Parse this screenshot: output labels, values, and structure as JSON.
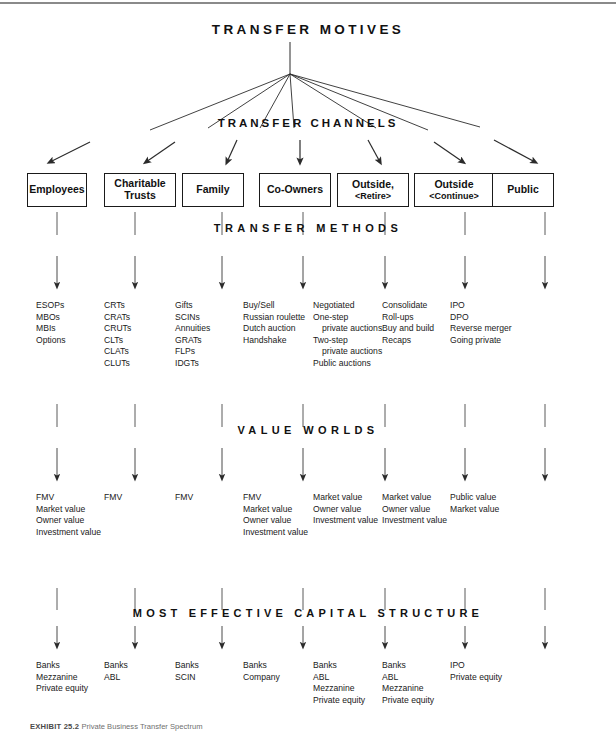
{
  "diagram": {
    "band_titles": {
      "motives": "TRANSFER MOTIVES",
      "channels": "TRANSFER CHANNELS",
      "methods": "TRANSFER METHODS",
      "value_worlds": "VALUE WORLDS",
      "capital_structure": "MOST EFFECTIVE CAPITAL STRUCTURE"
    },
    "channel_boxes": [
      {
        "line1": "Employees",
        "line2": ""
      },
      {
        "line1": "Charitable",
        "line2": "Trusts"
      },
      {
        "line1": "Family",
        "line2": ""
      },
      {
        "line1": "Co-Owners",
        "line2": ""
      },
      {
        "line1": "Outside,",
        "line2": "<Retire>"
      },
      {
        "line1": "Outside",
        "line2": "<Continue>"
      },
      {
        "line1": "Public",
        "line2": ""
      }
    ],
    "transfer_methods": [
      [
        "ESOPs",
        "MBOs",
        "MBIs",
        "Options"
      ],
      [
        "CRTs",
        "CRATs",
        "CRUTs",
        "CLTs",
        "CLATs",
        "CLUTs"
      ],
      [
        "Gifts",
        "SCINs",
        "Annuities",
        "GRATs",
        "FLPs",
        "IDGTs"
      ],
      [
        "Buy/Sell",
        "Russian roulette",
        "Dutch auction",
        "Handshake"
      ],
      [
        "Negotiated",
        "One-step",
        "private auctions",
        "Two-step",
        "private auctions",
        "Public auctions"
      ],
      [
        "Consolidate",
        "Roll-ups",
        "Buy and build",
        "Recaps"
      ],
      [
        "IPO",
        "DPO",
        "Reverse merger",
        "Going private"
      ]
    ],
    "transfer_methods_indented": [
      [],
      [],
      [],
      [],
      [
        2,
        4
      ],
      [],
      []
    ],
    "value_worlds": [
      [
        "FMV",
        "Market value",
        "Owner value",
        "Investment value"
      ],
      [
        "FMV"
      ],
      [
        "FMV"
      ],
      [
        "FMV",
        "Market value",
        "Owner value",
        "Investment value"
      ],
      [
        "Market value",
        "Owner value",
        "Investment value"
      ],
      [
        "Market value",
        "Owner value",
        "Investment value"
      ],
      [
        "Public value",
        "Market value"
      ]
    ],
    "capital_structure": [
      [
        "Banks",
        "Mezzanine",
        "Private equity"
      ],
      [
        "Banks",
        "ABL"
      ],
      [
        "Banks",
        "SCIN"
      ],
      [
        "Banks",
        "Company"
      ],
      [
        "Banks",
        "ABL",
        "Mezzanine",
        "Private equity"
      ],
      [
        "Banks",
        "ABL",
        "Mezzanine",
        "Private equity"
      ],
      [
        "IPO",
        "Private equity"
      ]
    ],
    "caption": {
      "label": "EXHIBIT 25.2",
      "text": "Private Business Transfer Spectrum"
    },
    "colors": {
      "ink": "#1a1a1a",
      "rule": "#8a8a8a",
      "arrow": "#333333",
      "caption": "#6f6f6f"
    }
  }
}
